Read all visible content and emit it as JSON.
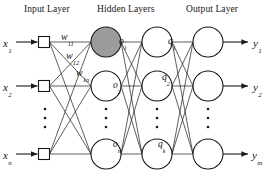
{
  "headers": [
    {
      "id": "input-layer-header",
      "text": "Input Layer",
      "x": 24,
      "y": 4
    },
    {
      "id": "hidden-layers-header",
      "text": "Hidden Layers",
      "x": 97,
      "y": 4
    },
    {
      "id": "output-layer-header",
      "text": "Output Layer",
      "x": 186,
      "y": 4
    }
  ],
  "inputs": [
    {
      "id": "input-x1",
      "base": "x",
      "sub": "1",
      "label_x": 3,
      "label_y": 33,
      "node_x": 44,
      "node_y": 42
    },
    {
      "id": "input-x2",
      "base": "x",
      "sub": "2",
      "label_x": 3,
      "label_y": 77,
      "node_x": 44,
      "node_y": 86
    },
    {
      "id": "input-xn",
      "base": "x",
      "sub": "n",
      "label_x": 3,
      "label_y": 145,
      "node_x": 44,
      "node_y": 154
    }
  ],
  "hidden1": [
    {
      "id": "hidden1-o1",
      "base": "o",
      "sub": "1",
      "cx": 106,
      "cy": 42,
      "shaded": true,
      "label_x": 119,
      "label_y": 30
    },
    {
      "id": "hidden1-o2",
      "base": "o",
      "sub": "2",
      "cx": 106,
      "cy": 86,
      "shaded": false,
      "label_x": 113,
      "label_y": 74
    },
    {
      "id": "hidden1-on",
      "base": "o",
      "sub": "n",
      "cx": 106,
      "cy": 154,
      "shaded": false,
      "label_x": 113,
      "label_y": 133
    }
  ],
  "hidden2": [
    {
      "id": "hidden2-q1",
      "base": "q",
      "sub": "1",
      "cx": 157,
      "cy": 42,
      "label_x": 168,
      "label_y": 30
    },
    {
      "id": "hidden2-q2",
      "base": "q",
      "sub": "2",
      "cx": 157,
      "cy": 86,
      "label_x": 162,
      "label_y": 66
    },
    {
      "id": "hidden2-qk",
      "base": "q",
      "sub": "k",
      "cx": 157,
      "cy": 154,
      "label_x": 158,
      "label_y": 133
    }
  ],
  "outputs": [
    {
      "id": "output-y1",
      "base": "y",
      "sub": "1",
      "cx": 208,
      "cy": 42,
      "label_x": 253,
      "label_y": 33
    },
    {
      "id": "output-y2",
      "base": "y",
      "sub": "2",
      "cx": 208,
      "cy": 86,
      "label_x": 253,
      "label_y": 77
    },
    {
      "id": "output-ym",
      "base": "y",
      "sub": "m",
      "cx": 208,
      "cy": 154,
      "label_x": 252,
      "label_y": 145
    }
  ],
  "weights": [
    {
      "id": "weight-w11",
      "base": "w",
      "sub": "11",
      "x": 61,
      "y": 26
    },
    {
      "id": "weight-w12",
      "base": "w",
      "sub": "12",
      "x": 66,
      "y": 45
    },
    {
      "id": "weight-w1n",
      "base": "w",
      "sub": "1n",
      "x": 76,
      "y": 62
    }
  ],
  "ellipses": [
    {
      "id": "ellipsis-input",
      "cx": 45,
      "cy": 118
    },
    {
      "id": "ellipsis-hidden1",
      "cx": 106,
      "cy": 118
    },
    {
      "id": "ellipsis-hidden2",
      "cx": 157,
      "cy": 118
    },
    {
      "id": "ellipsis-output",
      "cx": 208,
      "cy": 118
    }
  ],
  "geometry": {
    "node_radius": 15,
    "square_size": 11,
    "stroke_color": "#1a1a1a",
    "shaded_fill": "#9c9c9c",
    "node_fill": "#ffffff",
    "edge_width": 0.7,
    "arrow_x_start": 16,
    "output_arrow_end": 248
  }
}
